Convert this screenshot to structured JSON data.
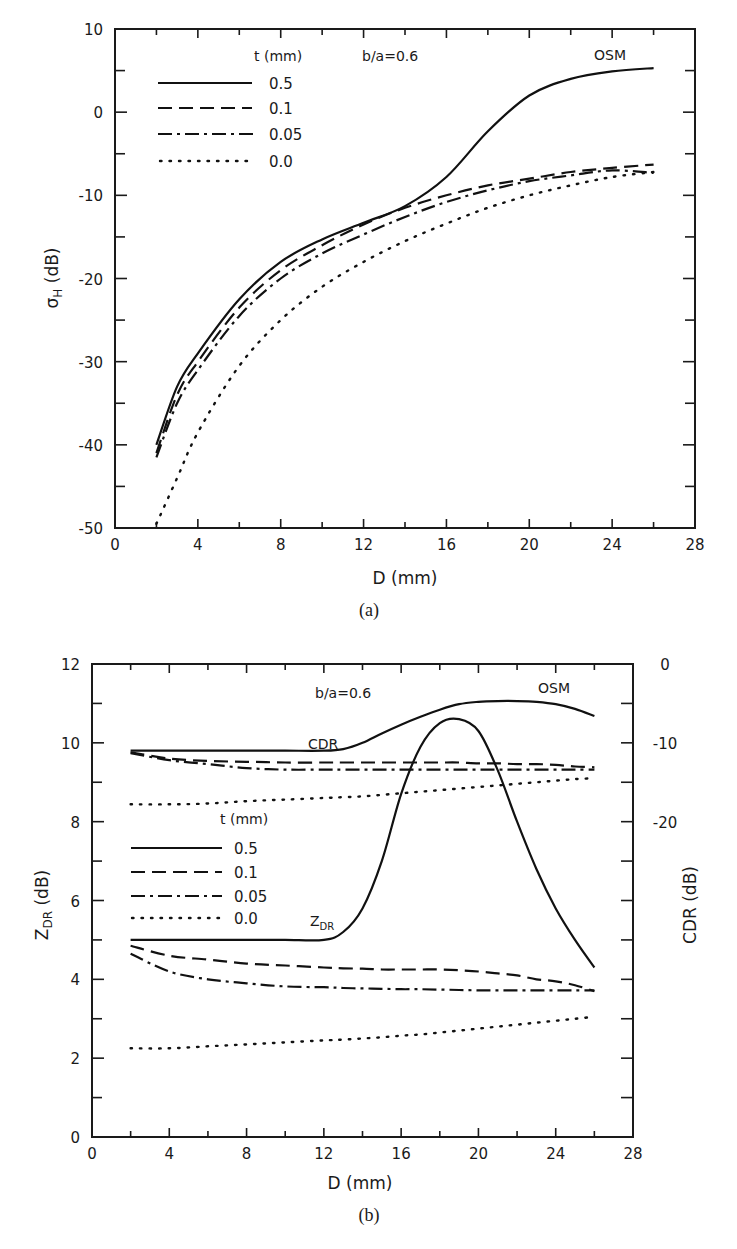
{
  "panels": {
    "a": {
      "caption": "(a)",
      "ylabel_main": "σ",
      "ylabel_sub": "H",
      "ylabel_unit": " (dB)",
      "xlabel": "D (mm)",
      "annotation_ratio": "b/a=0.6",
      "annotation_model": "OSM",
      "legend_title": "t (mm)",
      "legend": [
        "0.5",
        "0.1",
        "0.05",
        "0.0"
      ]
    },
    "b": {
      "caption": "(b)",
      "ylabel_main": "Z",
      "ylabel_sub": "DR",
      "ylabel_unit": " (dB)",
      "ylabel_right": "CDR (dB)",
      "xlabel": "D (mm)",
      "annotation_ratio": "b/a=0.6",
      "annotation_model": "OSM",
      "annotation_cdr": "CDR",
      "annotation_zdr_main": "Z",
      "annotation_zdr_sub": "DR",
      "legend_title": "t (mm)",
      "legend": [
        "0.5",
        "0.1",
        "0.05",
        "0.0"
      ]
    }
  },
  "chart_data": [
    {
      "type": "line",
      "title": "(a)",
      "xlabel": "D (mm)",
      "ylabel": "σH (dB)",
      "xlim": [
        0,
        28
      ],
      "ylim": [
        -50,
        10
      ],
      "xticks": [
        0,
        4,
        8,
        12,
        16,
        20,
        24,
        28
      ],
      "yticks": [
        10,
        0,
        -10,
        -20,
        -30,
        -40,
        -50
      ],
      "grid": false,
      "legend_title": "t (mm)",
      "legend_position": "upper-left",
      "annotations": [
        "b/a=0.6",
        "OSM"
      ],
      "x": [
        2,
        3,
        4,
        6,
        8,
        10,
        12,
        14,
        16,
        18,
        20,
        22,
        24,
        26
      ],
      "series": [
        {
          "name": "0.5",
          "style": "solid",
          "values": [
            -40,
            -33,
            -29,
            -22.5,
            -18,
            -15.3,
            -13.3,
            -11.3,
            -7.8,
            -2.3,
            2,
            4,
            4.9,
            5.3
          ]
        },
        {
          "name": "0.1",
          "style": "dashed",
          "values": [
            -41,
            -34,
            -30,
            -23.5,
            -19,
            -16,
            -13.5,
            -11.5,
            -10,
            -8.8,
            -8,
            -7.2,
            -6.7,
            -6.3
          ]
        },
        {
          "name": "0.05",
          "style": "dashdot",
          "values": [
            -41.5,
            -35,
            -31,
            -24.5,
            -20,
            -17,
            -14.7,
            -12.6,
            -10.8,
            -9.4,
            -8.3,
            -7.6,
            -7,
            -7.3
          ]
        },
        {
          "name": "0.0",
          "style": "dotted",
          "values": [
            -49.5,
            -44,
            -38.5,
            -30.5,
            -25,
            -21,
            -18,
            -15.5,
            -13.4,
            -11.5,
            -10,
            -8.8,
            -7.8,
            -7.2
          ]
        }
      ]
    },
    {
      "type": "line",
      "title": "(b)",
      "xlabel": "D (mm)",
      "ylabel": "ZDR (dB)",
      "ylabel_right": "CDR (dB)",
      "xlim": [
        0,
        28
      ],
      "ylim": [
        0,
        12
      ],
      "ylim_right": [
        -60,
        0
      ],
      "xticks": [
        0,
        4,
        8,
        12,
        16,
        20,
        24,
        28
      ],
      "yticks": [
        0,
        2,
        4,
        6,
        8,
        10,
        12
      ],
      "yticks_right": [
        0,
        -10,
        -20
      ],
      "grid": false,
      "legend_title": "t (mm)",
      "legend_position": "center-left",
      "annotations": [
        "b/a=0.6",
        "OSM",
        "CDR",
        "ZDR"
      ],
      "x": [
        2,
        4,
        6,
        8,
        10,
        12,
        13,
        14,
        15,
        16,
        17,
        18,
        19,
        20,
        21,
        22,
        23,
        24,
        25,
        26
      ],
      "series": [
        {
          "name": "CDR 0.5",
          "style": "solid",
          "axis": "right",
          "values": [
            -11,
            -11,
            -11,
            -11,
            -11,
            -11,
            -10.8,
            -10,
            -8.8,
            -7.7,
            -6.7,
            -5.8,
            -5.1,
            -4.8,
            -4.7,
            -4.7,
            -4.8,
            -5.1,
            -5.7,
            -6.6
          ]
        },
        {
          "name": "CDR 0.1",
          "style": "dashed",
          "axis": "right",
          "values": [
            -11.2,
            -12,
            -12.3,
            -12.4,
            -12.5,
            -12.5,
            -12.5,
            -12.5,
            -12.5,
            -12.5,
            -12.5,
            -12.5,
            -12.5,
            -12.6,
            -12.6,
            -12.7,
            -12.7,
            -12.8,
            -13.0,
            -13.1
          ]
        },
        {
          "name": "CDR 0.05",
          "style": "dashdot",
          "axis": "right",
          "values": [
            -11.3,
            -12.2,
            -12.7,
            -13.2,
            -13.4,
            -13.4,
            -13.4,
            -13.4,
            -13.4,
            -13.4,
            -13.4,
            -13.4,
            -13.4,
            -13.4,
            -13.4,
            -13.4,
            -13.4,
            -13.4,
            -13.4,
            -13.4
          ]
        },
        {
          "name": "CDR 0.0",
          "style": "dotted",
          "axis": "right",
          "values": [
            -17.8,
            -17.8,
            -17.7,
            -17.4,
            -17.2,
            -17,
            -16.9,
            -16.8,
            -16.6,
            -16.4,
            -16.2,
            -16,
            -15.8,
            -15.6,
            -15.4,
            -15.2,
            -15.0,
            -14.8,
            -14.6,
            -14.5
          ]
        },
        {
          "name": "ZDR 0.5",
          "style": "solid",
          "axis": "left",
          "values": [
            5.0,
            5.0,
            5.0,
            5.0,
            5.0,
            5.0,
            5.2,
            5.8,
            7.0,
            8.7,
            9.9,
            10.5,
            10.6,
            10.3,
            9.3,
            8.0,
            6.8,
            5.8,
            5.0,
            4.3
          ]
        },
        {
          "name": "ZDR 0.1",
          "style": "dashed",
          "axis": "left",
          "values": [
            4.85,
            4.6,
            4.5,
            4.4,
            4.35,
            4.3,
            4.28,
            4.27,
            4.25,
            4.25,
            4.25,
            4.25,
            4.23,
            4.2,
            4.15,
            4.1,
            4.0,
            3.95,
            3.85,
            3.7
          ]
        },
        {
          "name": "ZDR 0.05",
          "style": "dashdot",
          "axis": "left",
          "values": [
            4.65,
            4.2,
            4.0,
            3.9,
            3.82,
            3.8,
            3.78,
            3.77,
            3.76,
            3.75,
            3.75,
            3.74,
            3.73,
            3.72,
            3.72,
            3.72,
            3.72,
            3.72,
            3.72,
            3.72
          ]
        },
        {
          "name": "ZDR 0.0",
          "style": "dotted",
          "axis": "left",
          "values": [
            2.25,
            2.25,
            2.3,
            2.35,
            2.4,
            2.45,
            2.47,
            2.5,
            2.53,
            2.57,
            2.6,
            2.65,
            2.7,
            2.75,
            2.8,
            2.85,
            2.9,
            2.95,
            3.0,
            3.05
          ]
        }
      ]
    }
  ]
}
